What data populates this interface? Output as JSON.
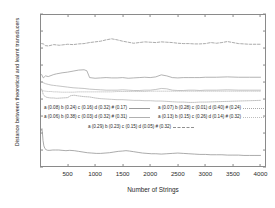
{
  "chart_data": {
    "type": "line",
    "title": "",
    "xlabel": "Number of Strings",
    "ylabel": "Distance between theoretical and learnt transducers",
    "xlim": [
      0,
      4100
    ],
    "ylim": [
      0,
      0.45
    ],
    "xticks": [
      500,
      1000,
      1500,
      2000,
      2500,
      3000,
      3500,
      4000
    ],
    "yticks": [
      "0",
      "0.05",
      "0.1",
      "0.15",
      "0.2",
      "0.25",
      "0.3",
      "0.35",
      "0.4",
      "0.45"
    ],
    "ytick_values": [
      0,
      0.05,
      0.1,
      0.15,
      0.2,
      0.25,
      0.3,
      0.35,
      0.4,
      0.45
    ],
    "grid": false,
    "legend_position": "center",
    "series": [
      {
        "name": "a (0.08) b (0.24) c (0.16) d (0.32) # (0.17)",
        "style": "solid",
        "color": "#9a9a9a",
        "x": [
          30,
          60,
          100,
          150,
          200,
          250,
          300,
          400,
          500,
          600,
          700,
          800,
          850,
          900,
          1000,
          1100,
          1200,
          1300,
          1400,
          1500,
          1600,
          1700,
          1800,
          1900,
          2000,
          2100,
          2200,
          2300,
          2400,
          2500,
          2600,
          2700,
          2800,
          2900,
          3000,
          3200,
          3400,
          3600,
          3800,
          4000
        ],
        "values": [
          0.272,
          0.262,
          0.268,
          0.266,
          0.269,
          0.272,
          0.274,
          0.277,
          0.279,
          0.282,
          0.285,
          0.286,
          0.283,
          0.263,
          0.261,
          0.262,
          0.263,
          0.262,
          0.262,
          0.263,
          0.261,
          0.262,
          0.263,
          0.264,
          0.263,
          0.265,
          0.271,
          0.268,
          0.263,
          0.262,
          0.263,
          0.263,
          0.263,
          0.263,
          0.264,
          0.264,
          0.265,
          0.264,
          0.264,
          0.264
        ]
      },
      {
        "name": "a (0.06) b (0.38) c (0.03) d (0.32) # (0.31)",
        "style": "solid",
        "color": "#b0b0b0",
        "x": [
          30,
          60,
          100,
          150,
          200,
          250,
          300,
          400,
          500,
          600,
          700,
          800,
          900,
          1000,
          1100,
          1200,
          1300,
          1400,
          1500,
          1600,
          1700,
          1800,
          1900,
          2000,
          2100,
          2200,
          2300,
          2400,
          2500,
          2600,
          2700,
          2800,
          2900,
          3000,
          3200,
          3400,
          3600,
          3800,
          4000
        ],
        "values": [
          0.251,
          0.248,
          0.245,
          0.243,
          0.241,
          0.24,
          0.239,
          0.237,
          0.235,
          0.233,
          0.232,
          0.231,
          0.229,
          0.228,
          0.227,
          0.226,
          0.226,
          0.226,
          0.227,
          0.226,
          0.225,
          0.225,
          0.226,
          0.226,
          0.228,
          0.231,
          0.23,
          0.226,
          0.225,
          0.225,
          0.226,
          0.226,
          0.225,
          0.226,
          0.226,
          0.227,
          0.226,
          0.226,
          0.226
        ]
      },
      {
        "name": "a (0.07) b (0.28) c (0.01) d (0.40) # (0.24)",
        "style": "dotted",
        "color": "#a8a8a8",
        "x": [
          30,
          60,
          100,
          150,
          200,
          250,
          300,
          400,
          500,
          560,
          620,
          700,
          800,
          900,
          1000,
          1100,
          1200,
          1300,
          1400,
          1500,
          1600,
          1700,
          1800,
          1900,
          2000,
          2100,
          2200,
          2300,
          2400,
          2500,
          2600,
          2700,
          2800,
          2900,
          3000,
          3200,
          3400,
          3600,
          3800,
          4000
        ],
        "values": [
          0.229,
          0.213,
          0.206,
          0.204,
          0.203,
          0.203,
          0.202,
          0.203,
          0.204,
          0.21,
          0.211,
          0.209,
          0.207,
          0.206,
          0.203,
          0.201,
          0.2,
          0.199,
          0.198,
          0.198,
          0.197,
          0.196,
          0.196,
          0.195,
          0.195,
          0.194,
          0.194,
          0.193,
          0.192,
          0.191,
          0.191,
          0.19,
          0.19,
          0.191,
          0.191,
          0.192,
          0.193,
          0.194,
          0.195,
          0.196
        ]
      },
      {
        "name": "a (0.13) b (0.15) c (0.26) d (0.14) # (0.32)",
        "style": "dotted",
        "color": "#bdbdbd",
        "x": [
          30,
          60,
          100,
          150,
          200,
          250,
          300,
          400,
          500,
          600,
          700,
          800,
          900,
          1000,
          1100,
          1200,
          1300,
          1400,
          1500,
          1600,
          1700,
          1800,
          1900,
          2000,
          2100,
          2200,
          2300,
          2400,
          2500,
          2600,
          2700,
          2800,
          2900,
          3000,
          3200,
          3400,
          3600,
          3800,
          4000
        ],
        "values": [
          0.226,
          0.224,
          0.223,
          0.222,
          0.222,
          0.221,
          0.221,
          0.22,
          0.22,
          0.22,
          0.221,
          0.221,
          0.221,
          0.221,
          0.221,
          0.221,
          0.221,
          0.222,
          0.222,
          0.222,
          0.222,
          0.222,
          0.222,
          0.223,
          0.223,
          0.223,
          0.223,
          0.223,
          0.223,
          0.223,
          0.223,
          0.223,
          0.223,
          0.223,
          0.223,
          0.223,
          0.223,
          0.223,
          0.223
        ]
      },
      {
        "name": "a (0.29) b (0.23) c (0.15) d (0.05) # (0.32)",
        "style": "dashed",
        "color": "#8f8f8f",
        "x": [
          30,
          60,
          100,
          150,
          200,
          250,
          300,
          350,
          400,
          500,
          600,
          700,
          800,
          900,
          1000,
          1100,
          1200,
          1300,
          1400,
          1500,
          1600,
          1700,
          1800,
          1900,
          2000,
          2100,
          2200,
          2300,
          2400,
          2500,
          2600,
          2700,
          2800,
          2900,
          3000,
          3100,
          3200,
          3300,
          3400,
          3500,
          3600,
          3700,
          3800,
          3900,
          4000
        ],
        "values": [
          0.363,
          0.362,
          0.357,
          0.356,
          0.358,
          0.36,
          0.359,
          0.358,
          0.359,
          0.361,
          0.36,
          0.362,
          0.363,
          0.366,
          0.368,
          0.37,
          0.374,
          0.377,
          0.374,
          0.37,
          0.367,
          0.364,
          0.366,
          0.368,
          0.367,
          0.366,
          0.368,
          0.367,
          0.366,
          0.364,
          0.363,
          0.363,
          0.362,
          0.362,
          0.363,
          0.366,
          0.364,
          0.366,
          0.369,
          0.366,
          0.363,
          0.362,
          0.361,
          0.361,
          0.361
        ]
      },
      {
        "name": "bottom-curve",
        "style": "solid",
        "color": "#8f8f8f",
        "x": [
          25,
          35,
          45,
          55,
          70,
          90,
          110,
          140,
          180,
          230,
          280,
          340,
          400,
          470,
          540,
          620,
          700,
          780,
          860,
          940,
          1020,
          1100,
          1180,
          1260,
          1340,
          1420,
          1500,
          1560,
          1620,
          1700,
          1780,
          1860,
          1940,
          2020,
          2100,
          2200,
          2300,
          2400,
          2500,
          2600,
          2700,
          2800,
          2900,
          3000,
          3100,
          3200,
          3300,
          3400,
          3500,
          3600,
          3700,
          3800,
          3900,
          4000
        ],
        "values": [
          0.108,
          0.113,
          0.098,
          0.078,
          0.062,
          0.054,
          0.051,
          0.049,
          0.049,
          0.05,
          0.05,
          0.05,
          0.049,
          0.048,
          0.049,
          0.048,
          0.046,
          0.044,
          0.042,
          0.041,
          0.04,
          0.04,
          0.041,
          0.042,
          0.044,
          0.046,
          0.047,
          0.048,
          0.047,
          0.045,
          0.043,
          0.041,
          0.04,
          0.039,
          0.039,
          0.038,
          0.039,
          0.04,
          0.041,
          0.04,
          0.039,
          0.038,
          0.037,
          0.037,
          0.036,
          0.036,
          0.036,
          0.035,
          0.035,
          0.035,
          0.034,
          0.034,
          0.034,
          0.034
        ]
      }
    ]
  },
  "legend": {
    "entries": [
      {
        "label": "a (0.08) b (0.24) c (0.16) d (0.32) # (0.17)",
        "style": "solid",
        "color": "#9a9a9a"
      },
      {
        "label": "a (0.07) b (0.28) c (0.01) d (0.40) # (0.24)",
        "style": "dotted",
        "color": "#a8a8a8"
      },
      {
        "label": "a (0.06) b (0.38) c (0.03) d (0.32) # (0.31)",
        "style": "solid",
        "color": "#b0b0b0"
      },
      {
        "label": "a (0.13) b (0.15) c (0.26) d (0.14) # (0.32)",
        "style": "dotted",
        "color": "#bdbdbd"
      },
      {
        "label": "a (0.29) b (0.23) c (0.15) d (0.05) # (0.32)",
        "style": "dashed",
        "color": "#8f8f8f"
      }
    ]
  },
  "colors": {
    "axis": "#8a8a8a",
    "text": "#2a2a2a",
    "background": "#ffffff"
  }
}
